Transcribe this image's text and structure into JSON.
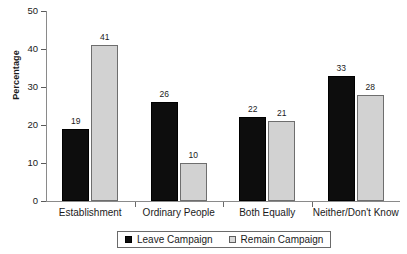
{
  "chart_data": {
    "type": "bar",
    "title": "",
    "xlabel": "",
    "ylabel": "Percentage",
    "ylim": [
      0,
      50
    ],
    "yticks": [
      0,
      10,
      20,
      30,
      40,
      50
    ],
    "ytick_labels": [
      "0",
      "10",
      "20",
      "30",
      "40",
      "50"
    ],
    "grid": false,
    "legend_position": "bottom",
    "categories": [
      "Establishment",
      "Ordinary People",
      "Both Equally",
      "Neither/Don't Know"
    ],
    "series": [
      {
        "name": "Leave Campaign",
        "color": "#0d0d0d",
        "values": [
          19,
          26,
          22,
          33
        ],
        "value_labels": [
          "19",
          "26",
          "22",
          "33"
        ]
      },
      {
        "name": "Remain Campaign",
        "color": "#d2d2d2",
        "values": [
          41,
          10,
          21,
          28
        ],
        "value_labels": [
          "41",
          "10",
          "21",
          "28"
        ]
      }
    ]
  },
  "legend": {
    "entries": [
      {
        "label": "Leave Campaign"
      },
      {
        "label": "Remain Campaign"
      }
    ]
  }
}
